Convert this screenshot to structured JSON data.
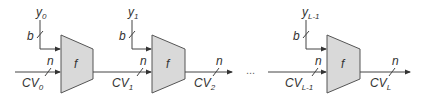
{
  "diagram": {
    "title": "",
    "stages": [
      {
        "y_label": "y",
        "y_sub": "0",
        "b_label": "b",
        "n_in_label": "n",
        "cv_in": "CV",
        "cv_in_sub": "0",
        "function": "f"
      },
      {
        "y_label": "y",
        "y_sub": "1",
        "b_label": "b",
        "n_in_label": "n",
        "cv_in": "CV",
        "cv_in_sub": "1",
        "function": "f",
        "cv_out": "CV",
        "cv_out_sub": "2",
        "n_out_label": "n"
      },
      {
        "y_label": "y",
        "y_sub": "L-1",
        "b_label": "b",
        "n_in_label": "n",
        "cv_in": "CV",
        "cv_in_sub": "L-1",
        "function": "f",
        "cv_out": "CV",
        "cv_out_sub": "L",
        "n_out_label": "n"
      }
    ],
    "ellipsis": "..."
  }
}
